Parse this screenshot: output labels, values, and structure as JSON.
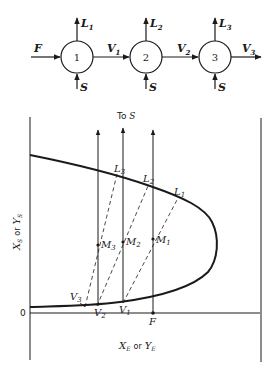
{
  "flow_diagram": {
    "feed_label": "F",
    "stages": [
      {
        "number": "1",
        "raffinate": "L",
        "raffinate_sub": "1",
        "solvent": "S",
        "extract_out": "V",
        "extract_out_sub": "1"
      },
      {
        "number": "2",
        "raffinate": "L",
        "raffinate_sub": "2",
        "solvent": "S",
        "extract_out": "V",
        "extract_out_sub": "2"
      },
      {
        "number": "3",
        "raffinate": "L",
        "raffinate_sub": "3",
        "solvent": "S",
        "extract_out": "V",
        "extract_out_sub": "3"
      }
    ]
  },
  "phase_diagram": {
    "to_s_label": "To S",
    "to_s_italic": "S",
    "y_axis_label": {
      "x": "X",
      "xsub": "S",
      "or": "or",
      "y": "Y",
      "ysub": "S"
    },
    "x_axis_label": {
      "x": "X",
      "xsub": "E",
      "or": "or",
      "y": "Y",
      "ysub": "E"
    },
    "origin_label": "0",
    "feed_point": "F",
    "raffinate_points": [
      {
        "label": "L",
        "sub": "1"
      },
      {
        "label": "L",
        "sub": "2"
      },
      {
        "label": "L",
        "sub": "3"
      }
    ],
    "mix_points": [
      {
        "label": "M",
        "sub": "1"
      },
      {
        "label": "M",
        "sub": "2"
      },
      {
        "label": "M",
        "sub": "3"
      }
    ],
    "extract_points": [
      {
        "label": "V",
        "sub": "1"
      },
      {
        "label": "V",
        "sub": "2"
      },
      {
        "label": "V",
        "sub": "3"
      }
    ]
  },
  "colors": {
    "ink": "#1a1a1a",
    "background": "#ffffff"
  }
}
